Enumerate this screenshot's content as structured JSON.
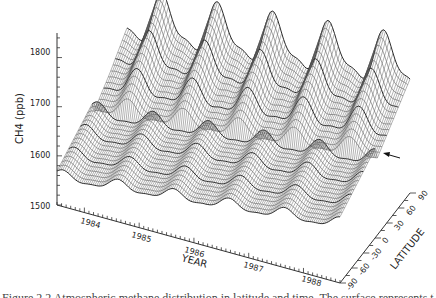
{
  "chart_data": {
    "type": "surface3d",
    "title": "",
    "zlabel": "CH4 (ppb)",
    "xlabel": "YEAR",
    "ylabel": "LATITUDE",
    "z_ticks": [
      1500,
      1600,
      1700,
      1800
    ],
    "zlim": [
      1500,
      1850
    ],
    "x_ticks": [
      "1984",
      "1985",
      "1986",
      "1987",
      "1988"
    ],
    "xlim": [
      1983.5,
      1988.6
    ],
    "y_ticks": [
      "-90",
      "-60",
      "-30",
      "0",
      "30",
      "60",
      "90"
    ],
    "ylim": [
      -90,
      90
    ],
    "series": [
      {
        "name": "south-pole CH4 (approx)",
        "latitude": -90,
        "mean_start": 1560,
        "trend_per_year": 12,
        "seasonal_amplitude": 10
      },
      {
        "name": "equator CH4 (approx)",
        "latitude": 0,
        "mean_start": 1600,
        "trend_per_year": 12,
        "seasonal_amplitude": 15
      },
      {
        "name": "north-pole CH4 (approx)",
        "latitude": 90,
        "mean_start": 1700,
        "trend_per_year": 12,
        "seasonal_amplitude": 45
      }
    ],
    "annotation": {
      "type": "arrow",
      "label": "",
      "points_to": "surface edge near 1600 ppb at equator"
    },
    "grid": false,
    "legend": "none"
  },
  "caption": "Figure 2.2  Atmospheric methane distribution in latitude and time. The surface represents the concentration of CH4 ..."
}
